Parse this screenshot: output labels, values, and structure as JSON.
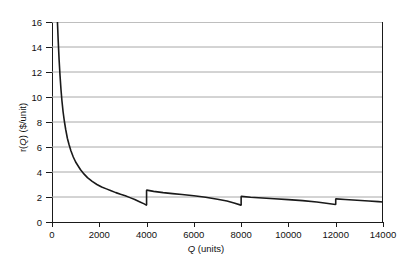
{
  "chart_data": {
    "type": "line",
    "title": "",
    "xlabel": "Q (units)",
    "xlabel_italic_part": "Q",
    "xlabel_rest": " (units)",
    "ylabel": "r(Q) ($/unit)",
    "ylabel_pre": "r(",
    "ylabel_italic_part": "Q",
    "ylabel_post": ") ($/unit)",
    "xlim": [
      0,
      14000
    ],
    "ylim": [
      0,
      16
    ],
    "xticks": [
      0,
      2000,
      4000,
      6000,
      8000,
      10000,
      12000,
      14000
    ],
    "xtick_labels": [
      "0",
      "2000",
      "4000",
      "6000",
      "8000",
      "10000",
      "12000",
      "14000"
    ],
    "yticks": [
      0,
      2,
      4,
      6,
      8,
      10,
      12,
      14,
      16
    ],
    "ytick_labels": [
      "0",
      "2",
      "4",
      "6",
      "8",
      "10",
      "12",
      "14",
      "16"
    ],
    "grid": "horizontal",
    "grid_color": "#a8a8a8",
    "line_color": "#1a1a1a",
    "line_width": 1.6,
    "legend": null,
    "discontinuities": [
      4000,
      8000,
      12000
    ],
    "series": [
      {
        "name": "r(Q)",
        "points": [
          [
            230,
            16.0
          ],
          [
            260,
            14.6
          ],
          [
            300,
            13.0
          ],
          [
            340,
            11.7
          ],
          [
            380,
            10.6
          ],
          [
            420,
            9.7
          ],
          [
            470,
            8.8
          ],
          [
            520,
            8.1
          ],
          [
            580,
            7.4
          ],
          [
            650,
            6.7
          ],
          [
            720,
            6.2
          ],
          [
            800,
            5.7
          ],
          [
            900,
            5.2
          ],
          [
            1000,
            4.8
          ],
          [
            1100,
            4.5
          ],
          [
            1200,
            4.2
          ],
          [
            1350,
            3.85
          ],
          [
            1500,
            3.55
          ],
          [
            1700,
            3.25
          ],
          [
            1900,
            3.0
          ],
          [
            2100,
            2.8
          ],
          [
            2300,
            2.65
          ],
          [
            2500,
            2.5
          ],
          [
            2700,
            2.35
          ],
          [
            2900,
            2.22
          ],
          [
            3100,
            2.1
          ],
          [
            3300,
            1.95
          ],
          [
            3500,
            1.8
          ],
          [
            3700,
            1.62
          ],
          [
            3900,
            1.45
          ],
          [
            3990,
            1.35
          ]
        ]
      },
      {
        "name": "r(Q) segment 2",
        "points": [
          [
            4010,
            2.55
          ],
          [
            4300,
            2.45
          ],
          [
            4700,
            2.35
          ],
          [
            5100,
            2.27
          ],
          [
            5500,
            2.2
          ],
          [
            6000,
            2.1
          ],
          [
            6500,
            1.98
          ],
          [
            7000,
            1.82
          ],
          [
            7400,
            1.68
          ],
          [
            7700,
            1.52
          ],
          [
            7990,
            1.35
          ]
        ]
      },
      {
        "name": "r(Q) segment 3",
        "points": [
          [
            8010,
            2.05
          ],
          [
            8400,
            1.98
          ],
          [
            8900,
            1.92
          ],
          [
            9400,
            1.86
          ],
          [
            10000,
            1.79
          ],
          [
            10600,
            1.71
          ],
          [
            11200,
            1.6
          ],
          [
            11600,
            1.5
          ],
          [
            11990,
            1.4
          ]
        ]
      },
      {
        "name": "r(Q) segment 4",
        "points": [
          [
            12010,
            1.85
          ],
          [
            12400,
            1.8
          ],
          [
            12900,
            1.74
          ],
          [
            13400,
            1.68
          ],
          [
            13800,
            1.63
          ],
          [
            14000,
            1.6
          ]
        ]
      }
    ]
  }
}
